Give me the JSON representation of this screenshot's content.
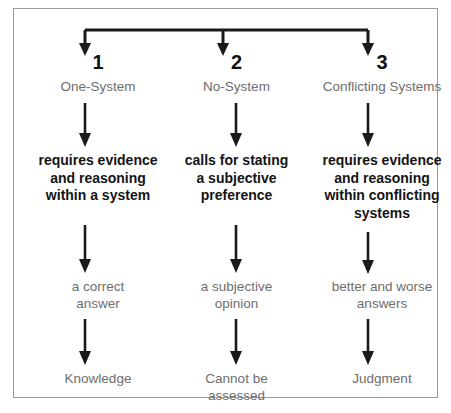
{
  "diagram": {
    "type": "flowchart",
    "title": "",
    "frame": {
      "border_color": "#9a9a9a",
      "background": "#ffffff"
    },
    "colors": {
      "heading_black": "#121212",
      "body_bold_black": "#141414",
      "label_gray": "#6e6e6e",
      "arrow_black": "#1a1a1a",
      "frame_gray": "#9a9a9a"
    },
    "columns": [
      {
        "numeral": "1",
        "system_label": "One-System",
        "description_lines": [
          "requires evidence",
          "and reasoning",
          "within a system"
        ],
        "result_lines": [
          "a correct",
          "answer"
        ],
        "outcome_lines": [
          "Knowledge"
        ]
      },
      {
        "numeral": "2",
        "system_label": "No-System",
        "description_lines": [
          "calls for stating",
          "a subjective",
          "preference"
        ],
        "result_lines": [
          "a subjective",
          "opinion"
        ],
        "outcome_lines": [
          "Cannot be",
          "assessed"
        ]
      },
      {
        "numeral": "3",
        "system_label": "Conflicting Systems",
        "description_lines": [
          "requires evidence",
          "and reasoning",
          "within conflicting",
          "systems"
        ],
        "result_lines": [
          "better and worse",
          "answers"
        ],
        "outcome_lines": [
          "Judgment"
        ]
      }
    ]
  }
}
